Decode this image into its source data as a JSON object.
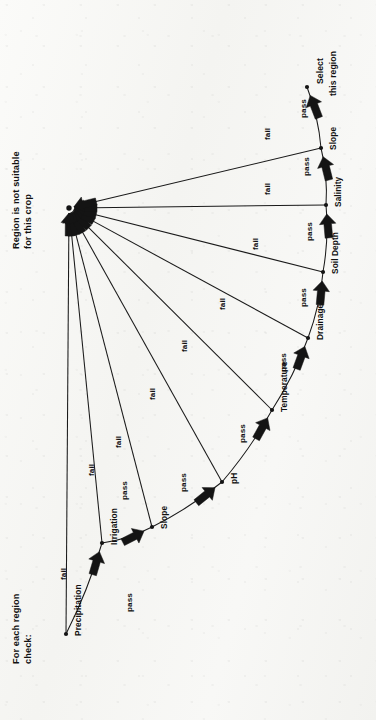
{
  "diagram": {
    "orientation": "rotated-90-ccw",
    "background_color": "#f7f7f5",
    "ink_color": "#141414",
    "notes": {
      "start_note_line1": "For each region",
      "start_note_line2": "check:",
      "reject_note_line1": "Region is not suitable",
      "reject_note_line2": "for this crop",
      "accept_note_line1": "Select",
      "accept_note_line2": "this region"
    },
    "stages": [
      {
        "id": "precipitation",
        "label": "Precipitation",
        "x": 66,
        "y": 634
      },
      {
        "id": "irrigation",
        "label": "Irrigation",
        "x": 102,
        "y": 543
      },
      {
        "id": "slope-1",
        "label": "Slope",
        "x": 152,
        "y": 527
      },
      {
        "id": "ph",
        "label": "pH",
        "x": 222,
        "y": 482
      },
      {
        "id": "temperature",
        "label": "Temperature",
        "x": 272,
        "y": 410
      },
      {
        "id": "drainage",
        "label": "Drainage",
        "x": 308,
        "y": 338
      },
      {
        "id": "soil-depth",
        "label": "Soil Depth",
        "x": 323,
        "y": 272
      },
      {
        "id": "salinity",
        "label": "Salinity",
        "x": 326,
        "y": 205
      },
      {
        "id": "slope-2",
        "label": "Slope",
        "x": 321,
        "y": 148
      },
      {
        "id": "accept",
        "label": "Select this region",
        "x": 307,
        "y": 87
      }
    ],
    "reject_node": {
      "id": "reject",
      "label": "Region is not suitable for this crop",
      "x": 69,
      "y": 208
    },
    "edge_labels": {
      "pass": "pass",
      "fail": "fail"
    },
    "pass_edges": [
      {
        "from": "precipitation",
        "to": "irrigation",
        "label": "pass",
        "lx": 126,
        "ly": 612
      },
      {
        "from": "irrigation",
        "to": "slope-1",
        "label": "pass",
        "lx": 121,
        "ly": 500
      },
      {
        "from": "slope-1",
        "to": "ph",
        "label": "pass",
        "lx": 180,
        "ly": 492
      },
      {
        "from": "ph",
        "to": "temperature",
        "label": "pass",
        "lx": 239,
        "ly": 443
      },
      {
        "from": "temperature",
        "to": "drainage",
        "label": "pass",
        "lx": 280,
        "ly": 372
      },
      {
        "from": "drainage",
        "to": "soil-depth",
        "label": "pass",
        "lx": 300,
        "ly": 307
      },
      {
        "from": "soil-depth",
        "to": "salinity",
        "label": "pass",
        "lx": 306,
        "ly": 241
      },
      {
        "from": "salinity",
        "to": "slope-2",
        "label": "pass",
        "lx": 303,
        "ly": 176
      },
      {
        "from": "slope-2",
        "to": "accept",
        "label": "pass",
        "lx": 300,
        "ly": 118
      }
    ],
    "fail_edges": [
      {
        "from": "precipitation",
        "to": "reject",
        "label": "fail",
        "lx": 60,
        "ly": 580
      },
      {
        "from": "irrigation",
        "to": "reject",
        "label": "fail",
        "lx": 88,
        "ly": 476
      },
      {
        "from": "slope-1",
        "to": "reject",
        "label": "fail",
        "lx": 115,
        "ly": 448
      },
      {
        "from": "ph",
        "to": "reject",
        "label": "fail",
        "lx": 149,
        "ly": 400
      },
      {
        "from": "temperature",
        "to": "reject",
        "label": "fail",
        "lx": 181,
        "ly": 352
      },
      {
        "from": "drainage",
        "to": "reject",
        "label": "fail",
        "lx": 219,
        "ly": 310
      },
      {
        "from": "soil-depth",
        "to": "reject",
        "label": "fail",
        "lx": 252,
        "ly": 250
      },
      {
        "from": "salinity",
        "to": "reject",
        "label": "fail",
        "lx": 264,
        "ly": 195
      },
      {
        "from": "slope-2",
        "to": "reject",
        "label": "fail",
        "lx": 264,
        "ly": 140
      }
    ]
  }
}
